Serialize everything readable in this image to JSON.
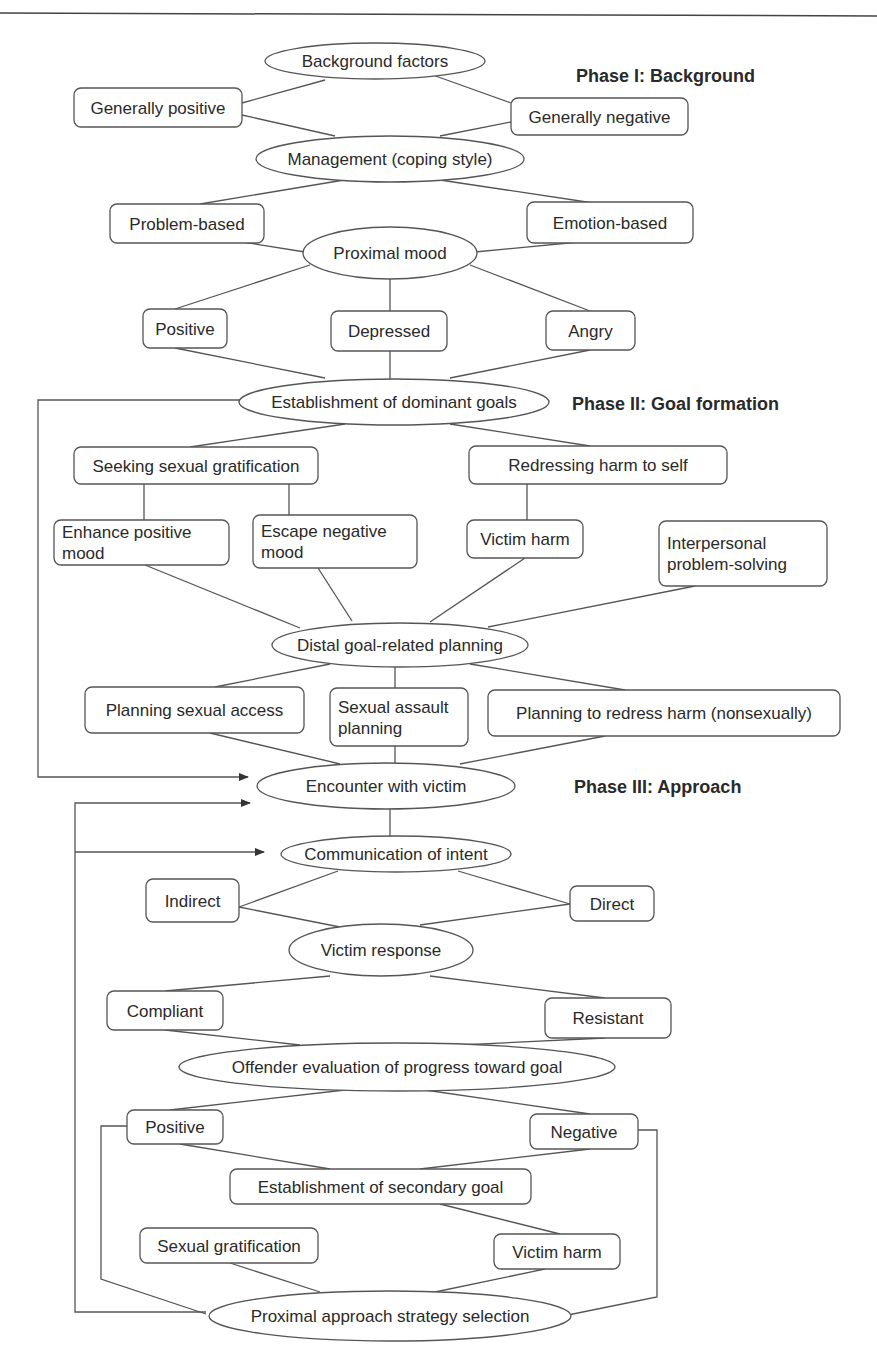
{
  "colors": {
    "line": "#555555",
    "text": "#2a2a2a",
    "background": "#ffffff"
  },
  "phases": [
    {
      "id": "p1",
      "label": "Phase I: Background",
      "x": 576,
      "y": 82
    },
    {
      "id": "p2",
      "label": "Phase II: Goal formation",
      "x": 572,
      "y": 410
    },
    {
      "id": "p3",
      "label": "Phase III: Approach",
      "x": 574,
      "y": 793
    }
  ],
  "nodes": [
    {
      "id": "background_factors",
      "shape": "ellipse",
      "cx": 375,
      "cy": 61,
      "rx": 110,
      "ry": 18,
      "lines": [
        "Background factors"
      ]
    },
    {
      "id": "generally_positive",
      "shape": "rect",
      "x": 74,
      "y": 88,
      "w": 168,
      "h": 39,
      "lines": [
        "Generally positive"
      ]
    },
    {
      "id": "generally_negative",
      "shape": "rect",
      "x": 511,
      "y": 98,
      "w": 177,
      "h": 37,
      "lines": [
        "Generally negative"
      ]
    },
    {
      "id": "management",
      "shape": "ellipse",
      "cx": 390,
      "cy": 159,
      "rx": 134,
      "ry": 23,
      "lines": [
        "Management (coping style)"
      ]
    },
    {
      "id": "problem_based",
      "shape": "rect",
      "x": 110,
      "y": 204,
      "w": 154,
      "h": 39,
      "lines": [
        "Problem-based"
      ]
    },
    {
      "id": "emotion_based",
      "shape": "rect",
      "x": 527,
      "y": 202,
      "w": 166,
      "h": 41,
      "lines": [
        "Emotion-based"
      ]
    },
    {
      "id": "proximal_mood",
      "shape": "ellipse",
      "cx": 390,
      "cy": 253,
      "rx": 87,
      "ry": 26,
      "lines": [
        "Proximal mood"
      ]
    },
    {
      "id": "mood_positive",
      "shape": "rect",
      "x": 143,
      "y": 309,
      "w": 84,
      "h": 39,
      "lines": [
        "Positive"
      ]
    },
    {
      "id": "mood_depressed",
      "shape": "rect",
      "x": 331,
      "y": 311,
      "w": 116,
      "h": 40,
      "lines": [
        "Depressed"
      ]
    },
    {
      "id": "mood_angry",
      "shape": "rect",
      "x": 546,
      "y": 311,
      "w": 89,
      "h": 39,
      "lines": [
        "Angry"
      ]
    },
    {
      "id": "dominant_goals",
      "shape": "ellipse",
      "cx": 394,
      "cy": 402,
      "rx": 155,
      "ry": 23,
      "lines": [
        "Establishment of dominant goals"
      ]
    },
    {
      "id": "seeking_gratification",
      "shape": "rect",
      "x": 74,
      "y": 447,
      "w": 244,
      "h": 37,
      "lines": [
        "Seeking sexual gratification"
      ]
    },
    {
      "id": "redressing_harm",
      "shape": "rect",
      "x": 469,
      "y": 446,
      "w": 258,
      "h": 38,
      "lines": [
        "Redressing harm to self"
      ]
    },
    {
      "id": "enhance_positive",
      "shape": "rect",
      "x": 54,
      "y": 520,
      "w": 175,
      "h": 45,
      "lines": [
        "Enhance positive",
        "mood"
      ]
    },
    {
      "id": "escape_negative",
      "shape": "rect",
      "x": 253,
      "y": 515,
      "w": 164,
      "h": 53,
      "lines": [
        "Escape negative",
        "mood"
      ]
    },
    {
      "id": "victim_harm_1",
      "shape": "rect",
      "x": 467,
      "y": 520,
      "w": 116,
      "h": 38,
      "lines": [
        "Victim harm"
      ]
    },
    {
      "id": "interpersonal",
      "shape": "rect",
      "x": 659,
      "y": 521,
      "w": 168,
      "h": 65,
      "lines": [
        "Interpersonal",
        "problem-solving"
      ]
    },
    {
      "id": "distal_planning",
      "shape": "ellipse",
      "cx": 400,
      "cy": 645,
      "rx": 128,
      "ry": 22,
      "lines": [
        "Distal goal-related planning"
      ]
    },
    {
      "id": "planning_access",
      "shape": "rect",
      "x": 85,
      "y": 687,
      "w": 219,
      "h": 46,
      "lines": [
        "Planning sexual access"
      ]
    },
    {
      "id": "assault_planning",
      "shape": "rect",
      "x": 330,
      "y": 688,
      "w": 138,
      "h": 58,
      "lines": [
        "Sexual assault",
        "planning"
      ]
    },
    {
      "id": "planning_redress",
      "shape": "rect",
      "x": 488,
      "y": 690,
      "w": 352,
      "h": 46,
      "lines": [
        "Planning to redress harm (nonsexually)"
      ]
    },
    {
      "id": "encounter",
      "shape": "ellipse",
      "cx": 386,
      "cy": 786,
      "rx": 129,
      "ry": 23,
      "lines": [
        "Encounter with victim"
      ]
    },
    {
      "id": "communication",
      "shape": "ellipse",
      "cx": 396,
      "cy": 854,
      "rx": 115,
      "ry": 18,
      "lines": [
        "Communication of intent"
      ]
    },
    {
      "id": "indirect",
      "shape": "rect",
      "x": 146,
      "y": 879,
      "w": 93,
      "h": 43,
      "lines": [
        "Indirect"
      ]
    },
    {
      "id": "direct",
      "shape": "rect",
      "x": 570,
      "y": 886,
      "w": 84,
      "h": 35,
      "lines": [
        "Direct"
      ]
    },
    {
      "id": "victim_response",
      "shape": "ellipse",
      "cx": 381,
      "cy": 950,
      "rx": 92,
      "ry": 26,
      "lines": [
        "Victim response"
      ]
    },
    {
      "id": "compliant",
      "shape": "rect",
      "x": 107,
      "y": 991,
      "w": 116,
      "h": 39,
      "lines": [
        "Compliant"
      ]
    },
    {
      "id": "resistant",
      "shape": "rect",
      "x": 545,
      "y": 998,
      "w": 126,
      "h": 40,
      "lines": [
        "Resistant"
      ]
    },
    {
      "id": "offender_evaluation",
      "shape": "ellipse",
      "cx": 397,
      "cy": 1067,
      "rx": 218,
      "ry": 24,
      "lines": [
        "Offender evaluation of progress toward goal"
      ]
    },
    {
      "id": "eval_positive",
      "shape": "rect",
      "x": 127,
      "y": 1110,
      "w": 96,
      "h": 34,
      "lines": [
        "Positive"
      ]
    },
    {
      "id": "eval_negative",
      "shape": "rect",
      "x": 530,
      "y": 1114,
      "w": 108,
      "h": 35,
      "lines": [
        "Negative"
      ]
    },
    {
      "id": "secondary_goal",
      "shape": "rect",
      "x": 230,
      "y": 1169,
      "w": 301,
      "h": 35,
      "lines": [
        "Establishment of secondary goal"
      ]
    },
    {
      "id": "sexual_gratification",
      "shape": "rect",
      "x": 140,
      "y": 1228,
      "w": 178,
      "h": 35,
      "lines": [
        "Sexual gratification"
      ]
    },
    {
      "id": "victim_harm_2",
      "shape": "rect",
      "x": 494,
      "y": 1234,
      "w": 126,
      "h": 35,
      "lines": [
        "Victim harm"
      ]
    },
    {
      "id": "proximal_strategy",
      "shape": "ellipse",
      "cx": 390,
      "cy": 1316,
      "rx": 181,
      "ry": 25,
      "lines": [
        "Proximal approach strategy selection"
      ]
    }
  ],
  "edges": [
    [
      242,
      103,
      325,
      80
    ],
    [
      430,
      74,
      511,
      103
    ],
    [
      242,
      115,
      335,
      136
    ],
    [
      440,
      136,
      511,
      122
    ],
    [
      200,
      204,
      350,
      179
    ],
    [
      440,
      180,
      600,
      204
    ],
    [
      230,
      240,
      305,
      252
    ],
    [
      475,
      252,
      600,
      240
    ],
    [
      310,
      265,
      175,
      309
    ],
    [
      390,
      279,
      390,
      311
    ],
    [
      470,
      265,
      590,
      311
    ],
    [
      175,
      348,
      325,
      378
    ],
    [
      390,
      351,
      390,
      379
    ],
    [
      590,
      350,
      450,
      378
    ],
    [
      190,
      447,
      345,
      424
    ],
    [
      450,
      424,
      590,
      446
    ],
    [
      144,
      484,
      144,
      520
    ],
    [
      289,
      484,
      289,
      515
    ],
    [
      527,
      484,
      527,
      520
    ],
    [
      145,
      565,
      300,
      628
    ],
    [
      318,
      568,
      352,
      621
    ],
    [
      525,
      558,
      430,
      622
    ],
    [
      695,
      586,
      488,
      627
    ],
    [
      215,
      687,
      330,
      664
    ],
    [
      395,
      667,
      395,
      688
    ],
    [
      470,
      664,
      625,
      690
    ],
    [
      210,
      733,
      340,
      764
    ],
    [
      395,
      746,
      395,
      763
    ],
    [
      605,
      736,
      460,
      764
    ],
    [
      390,
      809,
      390,
      836
    ],
    [
      338,
      871,
      239,
      907
    ],
    [
      458,
      871,
      570,
      904
    ],
    [
      239,
      907,
      350,
      929
    ],
    [
      570,
      904,
      420,
      925
    ],
    [
      330,
      976,
      165,
      991
    ],
    [
      430,
      976,
      605,
      998
    ],
    [
      165,
      1030,
      300,
      1045
    ],
    [
      605,
      1038,
      460,
      1045
    ],
    [
      345,
      1090,
      170,
      1110
    ],
    [
      425,
      1090,
      590,
      1114
    ],
    [
      180,
      1144,
      330,
      1169
    ],
    [
      590,
      1149,
      420,
      1169
    ],
    [
      440,
      1204,
      560,
      1234
    ],
    [
      230,
      1263,
      320,
      1292
    ],
    [
      545,
      1269,
      435,
      1292
    ]
  ],
  "loops": [
    {
      "points": [
        [
          240,
          400
        ],
        [
          38,
          400
        ],
        [
          38,
          777
        ],
        [
          248,
          777
        ]
      ],
      "arrow": true
    },
    {
      "points": [
        [
          127,
          1126
        ],
        [
          101,
          1126
        ],
        [
          101,
          1279
        ],
        [
          206,
          1314
        ]
      ],
      "arrow": false
    },
    {
      "points": [
        [
          638,
          1130
        ],
        [
          657,
          1130
        ],
        [
          657,
          1297
        ],
        [
          568,
          1315
        ]
      ],
      "arrow": false
    },
    {
      "points": [
        [
          206,
          1312
        ],
        [
          75,
          1312
        ],
        [
          75,
          803
        ],
        [
          250,
          803
        ]
      ],
      "arrow": true
    },
    {
      "points": [
        [
          75,
          852
        ],
        [
          264,
          852
        ]
      ],
      "arrow": true
    }
  ]
}
